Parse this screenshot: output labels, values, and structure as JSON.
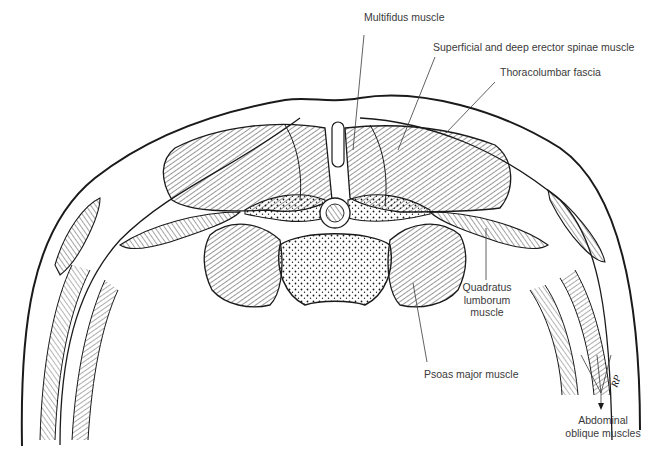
{
  "diagram": {
    "style": "pen-and-ink hatched line drawing",
    "colors": {
      "ink": "#1a1a1a",
      "label_text": "#3a3a3a",
      "background": "#ffffff"
    },
    "labels": {
      "multifidus": "Multifidus muscle",
      "erector_spinae": "Superficial and deep erector spinae muscle",
      "thoracolumbar_fascia": "Thoracolumbar fascia",
      "quadratus_line1": "Quadratus",
      "quadratus_line2": "lumborum",
      "quadratus_line3": "muscle",
      "psoas": "Psoas major muscle",
      "oblique_line1": "Abdominal",
      "oblique_line2": "oblique muscles"
    },
    "signature": "RP"
  }
}
